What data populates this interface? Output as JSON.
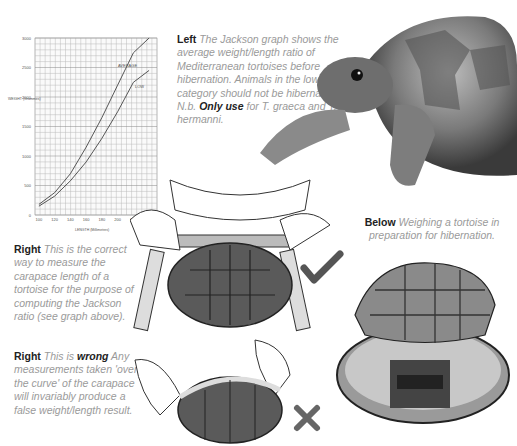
{
  "captions": {
    "left": {
      "label": "Left",
      "text_1": "The Jackson graph shows the average weight/length ratio of Mediterranean tortoises before hibernation. Animals in the low category should not be hibernated. N.b.",
      "emph": "Only use",
      "text_2": "for T. graeca and T. hermanni."
    },
    "right_correct": {
      "label": "Right",
      "text": "This is the correct way to measure the carapace length of a tortoise for the purpose of computing the Jackson ratio (see graph above)."
    },
    "right_wrong": {
      "label": "Right",
      "text_1": "This is",
      "emph": "wrong",
      "text_2": "Any measurements taken 'over the curve' of the carapace will invariably produce a false weight/length result."
    },
    "below": {
      "label": "Below",
      "text": "Weighing a tortoise in preparation for hibernation."
    }
  },
  "marks": {
    "check_color": "#555555",
    "cross_color": "#666666"
  },
  "chart_data": {
    "type": "line",
    "title": "Jackson graph",
    "xlabel": "LENGTH (Millimetres)",
    "ylabel": "WEIGHT (Grammes)",
    "x": [
      100,
      120,
      140,
      160,
      180,
      200,
      220,
      240
    ],
    "x_ticks": [
      "100",
      "120",
      "140",
      "160",
      "180",
      "200",
      "220"
    ],
    "y_ticks": [
      "0",
      "500",
      "1000",
      "1500",
      "2000",
      "2500",
      "3000"
    ],
    "ylim": [
      0,
      3000
    ],
    "xlim": [
      95,
      250
    ],
    "grid": true,
    "series": [
      {
        "name": "AVERAGE",
        "values": [
          180,
          380,
          700,
          1150,
          1650,
          2200,
          2750,
          3000
        ]
      },
      {
        "name": "LOW",
        "values": [
          150,
          320,
          580,
          900,
          1300,
          1750,
          2250,
          2450
        ]
      }
    ]
  }
}
